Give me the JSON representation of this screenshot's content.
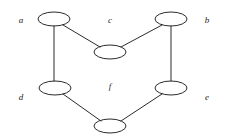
{
  "figure": {
    "background_color": "#ffffff",
    "stroke_color": "#2b2b2b",
    "label_color": "#1c1c1c"
  },
  "chart_data": {
    "type": "diagram",
    "title": "",
    "nodes": [
      {
        "id": "a",
        "label": "a",
        "cx": 54,
        "cy": 19,
        "rx": 16,
        "ry": 7,
        "label_x": 21,
        "label_y": 21
      },
      {
        "id": "b",
        "label": "b",
        "cx": 171,
        "cy": 19,
        "rx": 16,
        "ry": 7,
        "label_x": 207,
        "label_y": 21
      },
      {
        "id": "c",
        "label": "c",
        "cx": 110,
        "cy": 52,
        "rx": 16,
        "ry": 7,
        "label_x": 110,
        "label_y": 21
      },
      {
        "id": "d",
        "label": "d",
        "cx": 55,
        "cy": 88,
        "rx": 16,
        "ry": 7,
        "label_x": 21,
        "label_y": 98
      },
      {
        "id": "e",
        "label": "e",
        "cx": 171,
        "cy": 88,
        "rx": 16,
        "ry": 7,
        "label_x": 207,
        "label_y": 98
      },
      {
        "id": "f",
        "label": "f",
        "cx": 110,
        "cy": 126,
        "rx": 16,
        "ry": 7,
        "label_x": 110,
        "label_y": 87
      }
    ],
    "edges": [
      {
        "id": "edge-a-c",
        "from": "a",
        "to": "c",
        "x1": 63,
        "y1": 25,
        "x2": 100,
        "y2": 47
      },
      {
        "id": "edge-a-d",
        "from": "a",
        "to": "d",
        "x1": 54,
        "y1": 26,
        "x2": 54,
        "y2": 81
      },
      {
        "id": "edge-c-b",
        "from": "c",
        "to": "b",
        "x1": 121,
        "y1": 47,
        "x2": 162,
        "y2": 25
      },
      {
        "id": "edge-b-e",
        "from": "b",
        "to": "e",
        "x1": 171,
        "y1": 26,
        "x2": 171,
        "y2": 81
      },
      {
        "id": "edge-d-f",
        "from": "d",
        "to": "f",
        "x1": 63,
        "y1": 94,
        "x2": 101,
        "y2": 121
      },
      {
        "id": "edge-f-e",
        "from": "f",
        "to": "e",
        "x1": 121,
        "y1": 121,
        "x2": 162,
        "y2": 94
      }
    ],
    "node_count": 6,
    "edge_count": 6
  }
}
